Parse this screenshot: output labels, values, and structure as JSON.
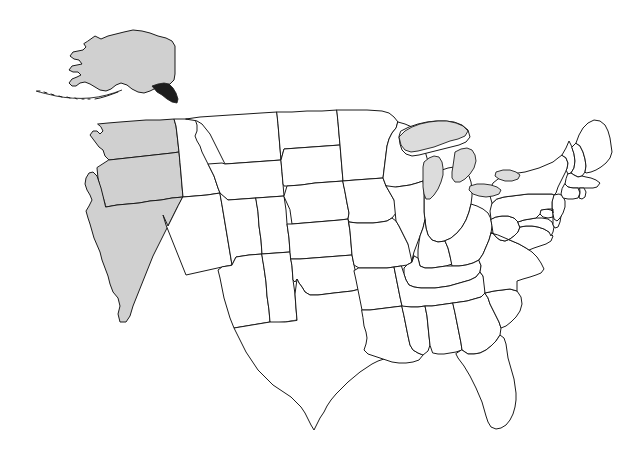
{
  "figure": {
    "kind": "choropleth-map",
    "title": "",
    "subtitle": "",
    "caption": "",
    "background_color": "#ffffff",
    "border_color": "#1a1a1a",
    "has_labels": false,
    "has_legend": false,
    "has_title": false,
    "projection_note": "contiguous-us-with-alaska-and-hawaii-insets"
  },
  "colors": {
    "highlight_fill": "#d0d0d0",
    "plain_fill": "#ffffff",
    "outline": "#1a1a1a",
    "lake_fill": "#dcdcdc",
    "panhandle_fill": "#1d1d1d"
  },
  "legend": {
    "visible": false,
    "highlighted_label": "Highlighted",
    "plain_label": "Not highlighted"
  },
  "summary": {
    "highlighted_count": 5,
    "plain_count": 45,
    "total_states": 50,
    "highlighted_group_name": "Pacific states"
  },
  "highlighted_states": [
    "Alaska",
    "Washington",
    "Oregon",
    "California",
    "Hawaii"
  ],
  "water_features": [
    "Lake Superior",
    "Lake Michigan",
    "Lake Huron",
    "Lake Erie",
    "Lake Ontario"
  ],
  "insets": {
    "alaska": {
      "name": "Alaska",
      "highlighted": true,
      "position": "upper-left"
    },
    "hawaii": {
      "name": "Hawaii",
      "highlighted": true,
      "position": "lower-left"
    }
  },
  "states": [
    {
      "code": "AK",
      "name": "Alaska",
      "highlighted": true
    },
    {
      "code": "HI",
      "name": "Hawaii",
      "highlighted": true
    },
    {
      "code": "WA",
      "name": "Washington",
      "highlighted": true
    },
    {
      "code": "OR",
      "name": "Oregon",
      "highlighted": true
    },
    {
      "code": "CA",
      "name": "California",
      "highlighted": true
    },
    {
      "code": "ID",
      "name": "Idaho",
      "highlighted": false
    },
    {
      "code": "NV",
      "name": "Nevada",
      "highlighted": false
    },
    {
      "code": "MT",
      "name": "Montana",
      "highlighted": false
    },
    {
      "code": "WY",
      "name": "Wyoming",
      "highlighted": false
    },
    {
      "code": "UT",
      "name": "Utah",
      "highlighted": false
    },
    {
      "code": "AZ",
      "name": "Arizona",
      "highlighted": false
    },
    {
      "code": "CO",
      "name": "Colorado",
      "highlighted": false
    },
    {
      "code": "NM",
      "name": "New Mexico",
      "highlighted": false
    },
    {
      "code": "ND",
      "name": "North Dakota",
      "highlighted": false
    },
    {
      "code": "SD",
      "name": "South Dakota",
      "highlighted": false
    },
    {
      "code": "NE",
      "name": "Nebraska",
      "highlighted": false
    },
    {
      "code": "KS",
      "name": "Kansas",
      "highlighted": false
    },
    {
      "code": "OK",
      "name": "Oklahoma",
      "highlighted": false
    },
    {
      "code": "TX",
      "name": "Texas",
      "highlighted": false
    },
    {
      "code": "MN",
      "name": "Minnesota",
      "highlighted": false
    },
    {
      "code": "IA",
      "name": "Iowa",
      "highlighted": false
    },
    {
      "code": "MO",
      "name": "Missouri",
      "highlighted": false
    },
    {
      "code": "AR",
      "name": "Arkansas",
      "highlighted": false
    },
    {
      "code": "LA",
      "name": "Louisiana",
      "highlighted": false
    },
    {
      "code": "WI",
      "name": "Wisconsin",
      "highlighted": false
    },
    {
      "code": "IL",
      "name": "Illinois",
      "highlighted": false
    },
    {
      "code": "MI",
      "name": "Michigan",
      "highlighted": false
    },
    {
      "code": "IN",
      "name": "Indiana",
      "highlighted": false
    },
    {
      "code": "OH",
      "name": "Ohio",
      "highlighted": false
    },
    {
      "code": "KY",
      "name": "Kentucky",
      "highlighted": false
    },
    {
      "code": "TN",
      "name": "Tennessee",
      "highlighted": false
    },
    {
      "code": "MS",
      "name": "Mississippi",
      "highlighted": false
    },
    {
      "code": "AL",
      "name": "Alabama",
      "highlighted": false
    },
    {
      "code": "GA",
      "name": "Georgia",
      "highlighted": false
    },
    {
      "code": "FL",
      "name": "Florida",
      "highlighted": false
    },
    {
      "code": "SC",
      "name": "South Carolina",
      "highlighted": false
    },
    {
      "code": "NC",
      "name": "North Carolina",
      "highlighted": false
    },
    {
      "code": "VA",
      "name": "Virginia",
      "highlighted": false
    },
    {
      "code": "WV",
      "name": "West Virginia",
      "highlighted": false
    },
    {
      "code": "MD",
      "name": "Maryland",
      "highlighted": false
    },
    {
      "code": "DE",
      "name": "Delaware",
      "highlighted": false
    },
    {
      "code": "PA",
      "name": "Pennsylvania",
      "highlighted": false
    },
    {
      "code": "NJ",
      "name": "New Jersey",
      "highlighted": false
    },
    {
      "code": "NY",
      "name": "New York",
      "highlighted": false
    },
    {
      "code": "CT",
      "name": "Connecticut",
      "highlighted": false
    },
    {
      "code": "RI",
      "name": "Rhode Island",
      "highlighted": false
    },
    {
      "code": "MA",
      "name": "Massachusetts",
      "highlighted": false
    },
    {
      "code": "VT",
      "name": "Vermont",
      "highlighted": false
    },
    {
      "code": "NH",
      "name": "New Hampshire",
      "highlighted": false
    },
    {
      "code": "ME",
      "name": "Maine",
      "highlighted": false
    }
  ]
}
